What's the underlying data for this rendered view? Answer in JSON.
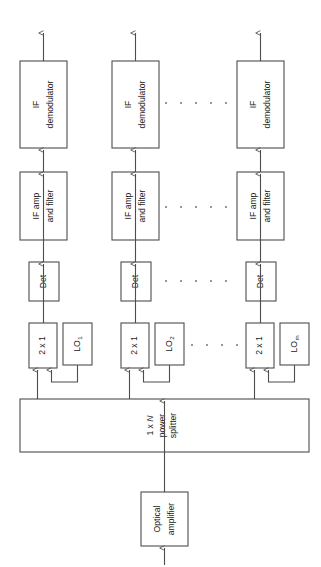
{
  "figure": {
    "orientation": "rotated-90-ccw",
    "background_color": "#ffffff",
    "line_color": "#4d4d4d",
    "text_color": "#1a1a1a",
    "dot_color": "#6b6b6b"
  },
  "input": {
    "label": ""
  },
  "optical_amplifier": {
    "line1": "Optical",
    "line2": "amplifier"
  },
  "power_splitter": {
    "line1_prefix": "1 x ",
    "line1_italic": "N",
    "line2": "power",
    "line3": "splitter"
  },
  "channels": [
    {
      "id": "channel-1",
      "coupler": "2 x 1",
      "lo_label": "LO",
      "lo_subscript": "1",
      "detector": "Det",
      "if_amp_line1": "IF amp",
      "if_amp_line2": "and filter",
      "if_demod_line1": "IF",
      "if_demod_line2": "demodulator"
    },
    {
      "id": "channel-2",
      "coupler": "2 x 1",
      "lo_label": "LO",
      "lo_subscript": "2",
      "detector": "Det",
      "if_amp_line1": "IF amp",
      "if_amp_line2": "and filter",
      "if_demod_line1": "IF",
      "if_demod_line2": "demodulator"
    },
    {
      "id": "channel-m",
      "coupler": "2 x 1",
      "lo_label": "LO",
      "lo_subscript": "m",
      "detector": "Det",
      "if_amp_line1": "IF amp",
      "if_amp_line2": "and filter",
      "if_demod_line1": "IF",
      "if_demod_line2": "demodulator"
    }
  ],
  "ellipses": {
    "symbol": "·",
    "count": 7,
    "rows": [
      "demodulator-row",
      "if-amp-row",
      "detector-row",
      "coupler-row"
    ]
  }
}
